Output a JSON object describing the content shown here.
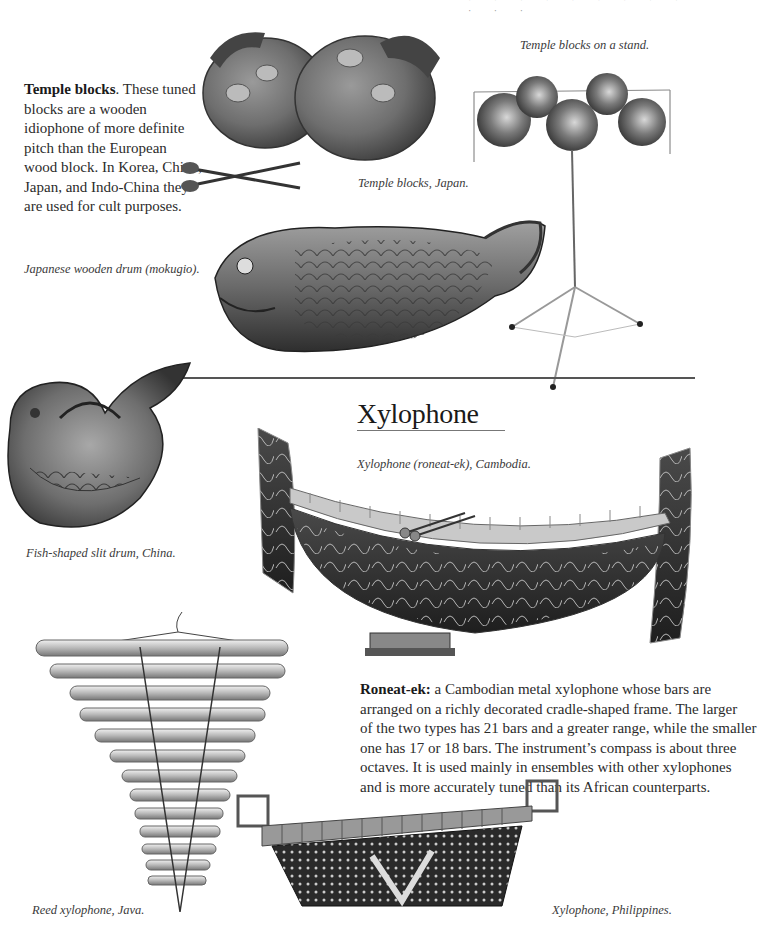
{
  "page": {
    "header_fragment": "· · · · · · · · · · · ·",
    "colors": {
      "ink": "#2a2a2a",
      "rule": "#555555",
      "background": "#ffffff"
    }
  },
  "temple_blocks": {
    "term": "Temple blocks",
    "description": ". These tuned blocks are a wooden idiophone of more definite pitch than the European wood block. In Korea, China, Japan, and Indo-China they are used for cult purposes.",
    "lines": [
      "blocks are a wooden",
      "idiophone of more definite",
      "pitch than the European",
      "wood block. In Korea, China,",
      "Japan, and Indo-China they",
      "are used for cult purposes."
    ],
    "first_line_rest": ". These tuned"
  },
  "captions": {
    "temple_blocks_japan": "Temple blocks, Japan.",
    "temple_blocks_stand": "Temple blocks on a stand.",
    "mokugio": "Japanese wooden drum (mokugio).",
    "fish_slit_drum": "Fish-shaped slit drum, China.",
    "roneat_ek": "Xylophone (roneat-ek), Cambodia.",
    "reed_xylophone": "Reed xylophone, Java.",
    "philippines": "Xylophone, Philippines."
  },
  "xylophone_section": {
    "heading": "Xylophone",
    "term": "Roneat-ek:",
    "lines": [
      " a Cambodian metal xylophone whose bars are",
      "arranged on a richly decorated cradle-shaped frame. The larger",
      "of the two types has 21 bars and a greater range, while the smaller",
      "one has 17 or 18 bars. The instrument’s compass is about three",
      "octaves. It is used mainly in ensembles with other xylophones",
      "and is more accurately tuned than its African counterparts."
    ]
  },
  "illustrations": [
    {
      "name": "temple-blocks-japan-image",
      "subject": "two lacquered temple blocks with two mallets"
    },
    {
      "name": "temple-blocks-stand-image",
      "subject": "five temple blocks mounted on a tripod stand"
    },
    {
      "name": "mokugio-image",
      "subject": "carved fish-shaped Japanese wooden drum"
    },
    {
      "name": "fish-slit-drum-image",
      "subject": "curled fish-shaped slit drum"
    },
    {
      "name": "roneat-ek-image",
      "subject": "cradle-shaped decorated Cambodian xylophone"
    },
    {
      "name": "reed-xylophone-image",
      "subject": "hanging bamboo reed xylophone"
    },
    {
      "name": "philippines-xylophone-image",
      "subject": "xylophone on carved trapezoid base"
    }
  ]
}
